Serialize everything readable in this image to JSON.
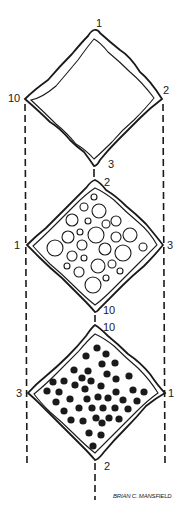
{
  "figure": {
    "credit": "BRIAN C. MANSFIELD",
    "colors": {
      "ink": "#1a1a1a",
      "background": "#ffffff"
    },
    "diamonds": [
      {
        "name": "empty",
        "contents": "empty",
        "labels": {
          "top": "1",
          "right": "2",
          "bottom": "3",
          "left": "10"
        }
      },
      {
        "name": "open-circles",
        "contents": "open circles of varying size",
        "labels": {
          "top": "2",
          "right": "3",
          "bottom": "10",
          "left": "1"
        }
      },
      {
        "name": "filled-dots",
        "contents": "filled black dots",
        "labels": {
          "top": "10",
          "right": "1",
          "bottom": "2",
          "left": "3"
        }
      }
    ],
    "open_circles": [
      [
        94,
        197,
        3
      ],
      [
        84,
        207,
        4
      ],
      [
        99,
        211,
        7
      ],
      [
        72,
        220,
        6
      ],
      [
        88,
        221,
        3
      ],
      [
        106,
        224,
        4
      ],
      [
        116,
        221,
        5
      ],
      [
        80,
        232,
        3
      ],
      [
        96,
        235,
        8
      ],
      [
        68,
        237,
        6
      ],
      [
        116,
        237,
        5
      ],
      [
        130,
        235,
        7
      ],
      [
        82,
        245,
        5
      ],
      [
        105,
        249,
        6
      ],
      [
        55,
        248,
        8
      ],
      [
        123,
        253,
        8
      ],
      [
        143,
        247,
        4
      ],
      [
        72,
        256,
        5
      ],
      [
        84,
        258,
        3
      ],
      [
        98,
        266,
        7
      ],
      [
        112,
        264,
        4
      ],
      [
        120,
        271,
        3
      ],
      [
        67,
        266,
        3
      ],
      [
        79,
        272,
        5
      ],
      [
        106,
        278,
        3
      ],
      [
        93,
        285,
        8
      ]
    ],
    "filled_dots": [
      [
        97,
        348
      ],
      [
        86,
        356
      ],
      [
        106,
        354
      ],
      [
        102,
        364
      ],
      [
        115,
        363
      ],
      [
        74,
        370
      ],
      [
        88,
        371
      ],
      [
        82,
        378
      ],
      [
        107,
        374
      ],
      [
        129,
        376
      ],
      [
        116,
        379
      ],
      [
        53,
        382
      ],
      [
        64,
        381
      ],
      [
        91,
        381
      ],
      [
        75,
        385
      ],
      [
        85,
        389
      ],
      [
        101,
        386
      ],
      [
        47,
        391
      ],
      [
        59,
        392
      ],
      [
        133,
        390
      ],
      [
        116,
        392
      ],
      [
        144,
        392
      ],
      [
        70,
        399
      ],
      [
        87,
        399
      ],
      [
        98,
        397
      ],
      [
        108,
        398
      ],
      [
        123,
        400
      ],
      [
        56,
        402
      ],
      [
        137,
        401
      ],
      [
        79,
        408
      ],
      [
        92,
        408
      ],
      [
        103,
        408
      ],
      [
        115,
        408
      ],
      [
        128,
        409
      ],
      [
        64,
        411
      ],
      [
        96,
        418
      ],
      [
        109,
        418
      ],
      [
        119,
        419
      ],
      [
        71,
        420
      ],
      [
        83,
        421
      ],
      [
        102,
        423
      ],
      [
        89,
        433
      ],
      [
        101,
        435
      ],
      [
        93,
        446
      ]
    ]
  }
}
